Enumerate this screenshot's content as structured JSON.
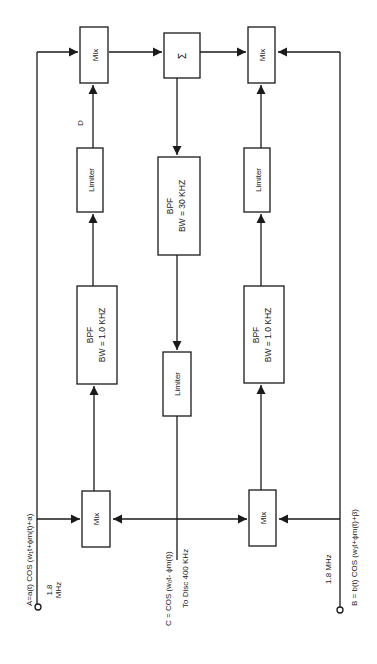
{
  "diagram": {
    "orientation": "rotated-90-ccw",
    "colors": {
      "line": "#1a1a1a",
      "background": "#ffffff"
    },
    "blocks": {
      "mix_top_left": {
        "label": "Mix"
      },
      "sum": {
        "label": "Σ"
      },
      "mix_top_right": {
        "label": "Mix"
      },
      "limiter_left": {
        "label": "Limiter"
      },
      "bpf_center": {
        "line1": "BPF",
        "line2": "BW = 30 KHZ"
      },
      "limiter_right": {
        "label": "Limiter"
      },
      "bpf_left": {
        "line1": "BPF",
        "line2": "BW = 1.0 KHZ"
      },
      "limiter_center": {
        "label": "Limiter"
      },
      "bpf_right": {
        "line1": "BPF",
        "line2": "BW = 1.0 KHZ"
      },
      "mix_bottom_left": {
        "label": "Mix"
      },
      "mix_bottom_right": {
        "label": "Mix"
      }
    },
    "labels": {
      "signal_d": "D",
      "input_a": "A=a(t) COS (w₁t+ϕm(t)+a)",
      "input_a_freq_1": "1.8",
      "input_a_freq_2": "MHz",
      "signal_c": "C = COS (w₀t- ϕm(t))",
      "to_disc": "To Disc 400 KHz",
      "input_b_freq": "1.8 MHz",
      "input_b": "B = b(t) COS (w₁t+ϕm(t)+β)"
    }
  }
}
